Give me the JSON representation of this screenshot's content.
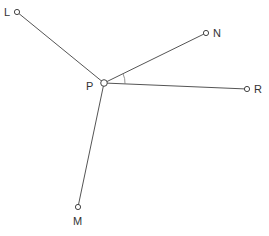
{
  "diagram": {
    "colors": {
      "line": "#555555",
      "point_fill": "#ffffff",
      "label": "#333333"
    },
    "center": {
      "id": "P",
      "label": "P",
      "x": 104,
      "y": 83
    },
    "points": [
      {
        "id": "L",
        "label": "L",
        "x": 17,
        "y": 12
      },
      {
        "id": "N",
        "label": "N",
        "x": 206,
        "y": 33
      },
      {
        "id": "R",
        "label": "R",
        "x": 247,
        "y": 89
      },
      {
        "id": "M",
        "label": "M",
        "x": 78,
        "y": 207
      }
    ],
    "angle_mark": {
      "between": [
        "N",
        "R"
      ],
      "vertex": "P"
    }
  }
}
